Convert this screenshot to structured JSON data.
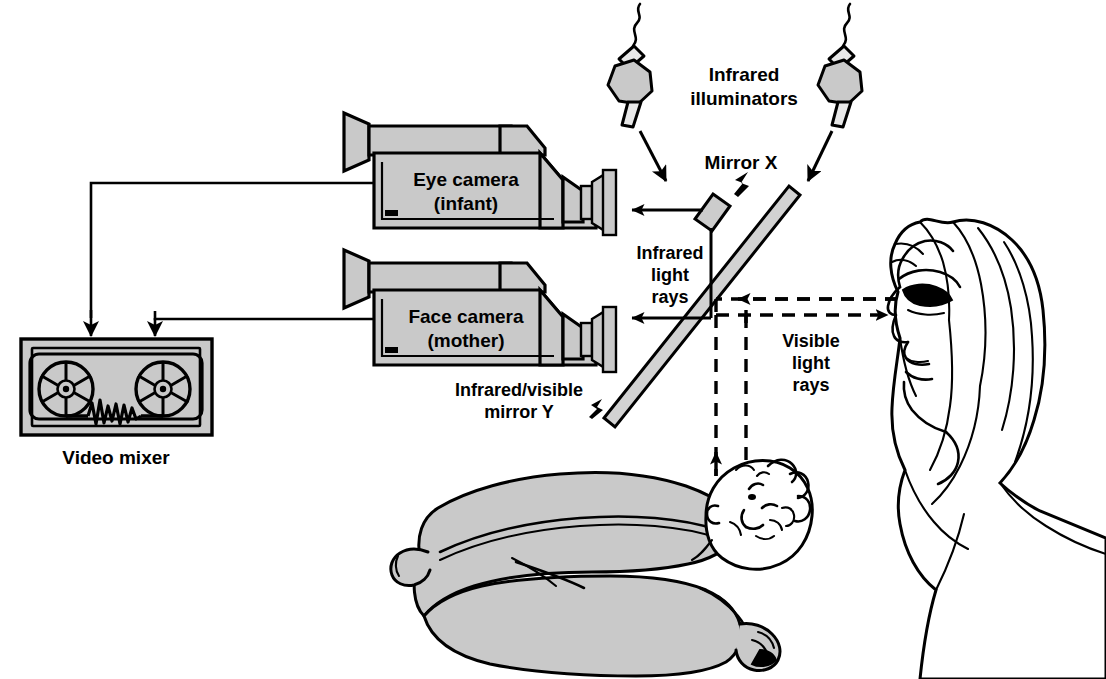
{
  "figure": {
    "type": "apparatus-schematic",
    "background_color": "#ffffff",
    "line_color": "#000000",
    "equipment_fill_color": "#c9c9c9"
  },
  "labels": {
    "eye_camera_line1": "Eye camera",
    "eye_camera_line2": "(infant)",
    "face_camera_line1": "Face camera",
    "face_camera_line2": "(mother)",
    "video_mixer": "Video mixer",
    "infrared_illuminators_line1": "Infrared",
    "infrared_illuminators_line2": "illuminators",
    "mirror_x": "Mirror X",
    "infrared_rays_line1": "Infrared",
    "infrared_rays_line2": "light",
    "infrared_rays_line3": "rays",
    "visible_rays_line1": "Visible",
    "visible_rays_line2": "light",
    "visible_rays_line3": "rays",
    "mirror_y_line1": "Infrared/visible",
    "mirror_y_line2": "mirror Y"
  },
  "components": [
    {
      "id": "eye-camera",
      "label": "Eye camera (infant)",
      "kind": "video-camera"
    },
    {
      "id": "face-camera",
      "label": "Face camera (mother)",
      "kind": "video-camera"
    },
    {
      "id": "video-mixer",
      "label": "Video mixer",
      "kind": "tape-deck"
    },
    {
      "id": "infrared-illuminator-left",
      "label": "Infrared illuminator",
      "kind": "lamp"
    },
    {
      "id": "infrared-illuminator-right",
      "label": "Infrared illuminator",
      "kind": "lamp"
    },
    {
      "id": "mirror-x",
      "label": "Mirror X",
      "kind": "mirror"
    },
    {
      "id": "mirror-y",
      "label": "Infrared/visible mirror Y",
      "kind": "beamsplitter"
    },
    {
      "id": "mother",
      "label": "Mother",
      "kind": "person-profile"
    },
    {
      "id": "infant",
      "label": "Infant",
      "kind": "person-reclining"
    }
  ],
  "rays": [
    {
      "id": "ir-to-eye-camera",
      "style": "solid",
      "label": "Infrared light rays"
    },
    {
      "id": "ir-to-face-camera",
      "style": "solid",
      "label": "Infrared light rays"
    },
    {
      "id": "visible-mother-to-mirror",
      "style": "dashed",
      "label": "Visible light rays"
    },
    {
      "id": "visible-mirror-to-mother",
      "style": "dashed",
      "label": "Visible light rays"
    },
    {
      "id": "visible-infant-to-mirror",
      "style": "dashed",
      "label": "Visible light rays"
    },
    {
      "id": "visible-mirror-to-infant",
      "style": "dashed",
      "label": "Visible light rays"
    }
  ]
}
